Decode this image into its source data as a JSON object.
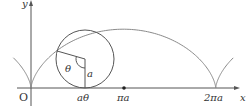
{
  "diagram": {
    "axes": {
      "x_label": "x",
      "y_label": "y",
      "origin_label": "O"
    },
    "x_ticks": [
      {
        "label": "aθ",
        "position": "contact point"
      },
      {
        "label": "πa",
        "position": "marked point"
      },
      {
        "label": "2πa",
        "position": "cusp"
      }
    ],
    "circle_labels": {
      "angle": "θ",
      "radius": "a"
    },
    "colors": {
      "stroke": "#555555",
      "curve": "#8a8a8a",
      "text": "#333333"
    }
  }
}
